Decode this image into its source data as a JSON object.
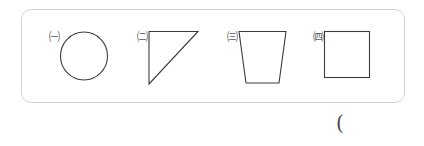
{
  "worksheet": {
    "answer_blank": "(",
    "border_color": "#d4d4d4",
    "stroke_color": "#3c3c3c",
    "background_color": "#ffffff"
  },
  "shapes": [
    {
      "marker": "㈠",
      "marker_letter": "ㄱ",
      "name": "circle",
      "name_ko": "원"
    },
    {
      "marker": "㈡",
      "marker_letter": "ㄴ",
      "name": "right-triangle",
      "name_ko": "직각삼각형"
    },
    {
      "marker": "㈢",
      "marker_letter": "ㄷ",
      "name": "trapezoid",
      "name_ko": "사다리꼴"
    },
    {
      "marker": "㈣",
      "marker_letter": "ㄹ",
      "name": "square",
      "name_ko": "정사각형"
    }
  ]
}
